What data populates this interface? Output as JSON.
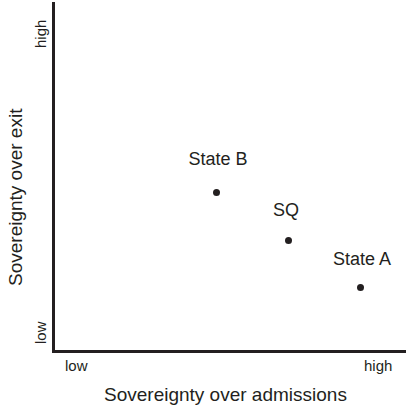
{
  "chart_data": {
    "type": "scatter",
    "title": "",
    "xlabel": "Sovereignty over admissions",
    "ylabel": "Sovereignty over exit",
    "xticklabels": [
      "low",
      "high"
    ],
    "yticklabels": [
      "low",
      "high"
    ],
    "xlim": [
      0,
      1
    ],
    "ylim": [
      0,
      1
    ],
    "grid": false,
    "legend": "none",
    "points": [
      {
        "label": "State B",
        "x": 0.463,
        "y": 0.453,
        "px": 216,
        "py": 192,
        "label_px": 218,
        "label_py": 150
      },
      {
        "label": "SQ",
        "x": 0.667,
        "y": 0.316,
        "px": 288,
        "py": 240,
        "label_px": 286,
        "label_py": 201
      },
      {
        "label": "State A",
        "x": 0.87,
        "y": 0.182,
        "px": 360,
        "py": 287,
        "label_px": 362,
        "label_py": 250
      }
    ]
  },
  "axes": {
    "y": {
      "title": "Sovereignty over exit",
      "tick_high": "high",
      "tick_low": "low"
    },
    "x": {
      "title": "Sovereignty over admissions",
      "tick_high": "high",
      "tick_low": "low"
    }
  },
  "colors": {
    "ink": "#231f20",
    "background": "#ffffff"
  }
}
